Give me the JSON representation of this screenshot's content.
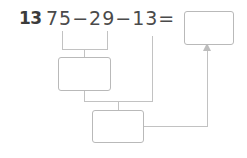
{
  "worksheet": {
    "problem_number": "13",
    "expression": "75−29−13=",
    "operands": [
      "75",
      "29",
      "13"
    ],
    "operators": [
      "−",
      "−"
    ],
    "equals_sign": "=",
    "boxes": [
      {
        "id": "box-step1",
        "label": "first-step-answer-box",
        "value": ""
      },
      {
        "id": "box-step2",
        "label": "second-step-answer-box",
        "value": ""
      },
      {
        "id": "box-final",
        "label": "final-answer-box",
        "value": ""
      }
    ],
    "colors": {
      "number_text": "#3b3b3b",
      "expression_text": "#4a4a4a",
      "box_border": "#b9b9b9",
      "connector": "#c2c2c2",
      "background": "#ffffff"
    }
  }
}
